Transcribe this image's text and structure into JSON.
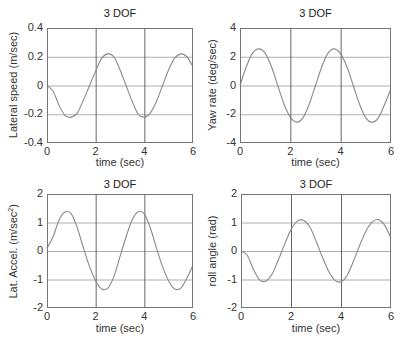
{
  "figure": {
    "background": "#ffffff",
    "axis_color": "#777777",
    "grid_color_h": "#9a9a9a",
    "grid_color_v": "#555555",
    "line_color": "#8a8a8a"
  },
  "chart_data": [
    {
      "type": "line",
      "title": "3 DOF",
      "xlabel": "time (sec)",
      "ylabel": "Lateral speed (m/sec)",
      "xlim": [
        0,
        6
      ],
      "ylim": [
        -0.4,
        0.4
      ],
      "xticks": [
        "0",
        "2",
        "4",
        "6"
      ],
      "yticks": [
        "-0.4",
        "-0.2",
        "0",
        "0.2",
        "0.4"
      ],
      "grid": true,
      "x": [
        0,
        0.25,
        0.5,
        0.75,
        1.0,
        1.25,
        1.5,
        1.75,
        2.0,
        2.25,
        2.5,
        2.75,
        3.0,
        3.25,
        3.5,
        3.75,
        4.0,
        4.25,
        4.5,
        4.75,
        5.0,
        5.25,
        5.5,
        5.75,
        6.0
      ],
      "series": [
        {
          "name": "Lateral speed",
          "values": [
            0,
            -0.04,
            -0.14,
            -0.21,
            -0.22,
            -0.19,
            -0.1,
            0.0,
            0.1,
            0.19,
            0.22,
            0.2,
            0.11,
            0.0,
            -0.11,
            -0.2,
            -0.22,
            -0.19,
            -0.11,
            0.0,
            0.11,
            0.19,
            0.22,
            0.2,
            0.13
          ]
        }
      ]
    },
    {
      "type": "line",
      "title": "3 DOF",
      "xlabel": "time (sec)",
      "ylabel": "Yaw rate (deg/sec)",
      "xlim": [
        0,
        6
      ],
      "ylim": [
        -4,
        4
      ],
      "xticks": [
        "0",
        "2",
        "4",
        "6"
      ],
      "yticks": [
        "-4",
        "-2",
        "0",
        "2",
        "4"
      ],
      "grid": true,
      "x": [
        0,
        0.25,
        0.5,
        0.75,
        1.0,
        1.25,
        1.5,
        1.75,
        2.0,
        2.25,
        2.5,
        2.75,
        3.0,
        3.25,
        3.5,
        3.75,
        4.0,
        4.25,
        4.5,
        4.75,
        5.0,
        5.25,
        5.5,
        5.75,
        6.0
      ],
      "series": [
        {
          "name": "Yaw rate",
          "values": [
            0,
            1.3,
            2.25,
            2.55,
            2.25,
            1.3,
            0.0,
            -1.3,
            -2.2,
            -2.55,
            -2.25,
            -1.3,
            0.0,
            1.3,
            2.25,
            2.55,
            2.2,
            1.3,
            0.0,
            -1.3,
            -2.25,
            -2.55,
            -2.25,
            -1.3,
            -0.2
          ]
        }
      ]
    },
    {
      "type": "line",
      "title": "3 DOF",
      "xlabel": "time (sec)",
      "ylabel": "Lat. Accel. (m/sec^2)",
      "xlim": [
        0,
        6
      ],
      "ylim": [
        -2,
        2
      ],
      "xticks": [
        "0",
        "2",
        "4",
        "6"
      ],
      "yticks": [
        "-2",
        "-1",
        "0",
        "1",
        "2"
      ],
      "grid": true,
      "x": [
        0,
        0.25,
        0.5,
        0.75,
        1.0,
        1.25,
        1.5,
        1.75,
        2.0,
        2.25,
        2.5,
        2.75,
        3.0,
        3.25,
        3.5,
        3.75,
        4.0,
        4.25,
        4.5,
        4.75,
        5.0,
        5.25,
        5.5,
        5.75,
        6.0
      ],
      "series": [
        {
          "name": "Lat. Accel.",
          "values": [
            0.1,
            0.5,
            1.1,
            1.38,
            1.3,
            0.8,
            0.1,
            -0.55,
            -1.05,
            -1.33,
            -1.3,
            -0.9,
            -0.2,
            0.5,
            1.1,
            1.38,
            1.3,
            0.8,
            0.1,
            -0.55,
            -1.05,
            -1.33,
            -1.3,
            -0.95,
            -0.5
          ]
        }
      ]
    },
    {
      "type": "line",
      "title": "3 DOF",
      "xlabel": "time (sec)",
      "ylabel": "roll angle (rad)",
      "xlim": [
        0,
        6
      ],
      "ylim": [
        -2,
        2
      ],
      "xticks": [
        "0",
        "2",
        "4",
        "6"
      ],
      "yticks": [
        "-2",
        "-1",
        "0",
        "1",
        "2"
      ],
      "grid": true,
      "x": [
        0,
        0.25,
        0.5,
        0.75,
        1.0,
        1.25,
        1.5,
        1.75,
        2.0,
        2.25,
        2.5,
        2.75,
        3.0,
        3.25,
        3.5,
        3.75,
        4.0,
        4.25,
        4.5,
        4.75,
        5.0,
        5.25,
        5.5,
        5.75,
        6.0
      ],
      "series": [
        {
          "name": "roll angle",
          "values": [
            0,
            -0.15,
            -0.65,
            -1.02,
            -1.05,
            -0.8,
            -0.3,
            0.25,
            0.75,
            1.05,
            1.08,
            0.85,
            0.35,
            -0.2,
            -0.7,
            -1.02,
            -1.08,
            -0.85,
            -0.35,
            0.2,
            0.7,
            1.02,
            1.1,
            0.9,
            0.45
          ]
        }
      ]
    }
  ],
  "panels": [
    {
      "title": "3 DOF",
      "xlabel": "time (sec)",
      "ylabel": "Lateral speed (m/sec)"
    },
    {
      "title": "3 DOF",
      "xlabel": "time (sec)",
      "ylabel": "Yaw rate (deg/sec)"
    },
    {
      "title": "3 DOF",
      "xlabel": "time (sec)",
      "ylabel_main": "Lat. Accel. (m/sec",
      "ylabel_sup": "2",
      "ylabel_tail": ")"
    },
    {
      "title": "3 DOF",
      "xlabel": "time (sec)",
      "ylabel": "roll angle (rad)"
    }
  ]
}
